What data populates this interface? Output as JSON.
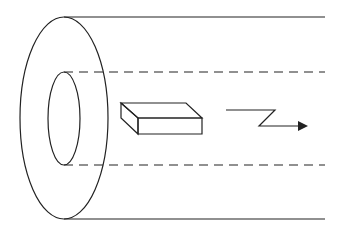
{
  "diagram": {
    "colors": {
      "stroke": "#222222",
      "background": "#ffffff"
    },
    "elements": [
      "outer-tube-ellipse",
      "inner-bore-ellipse",
      "tube-outer-lines",
      "bore-dashed-lines",
      "rectangular-block",
      "zigzag-direction-arrow"
    ]
  }
}
